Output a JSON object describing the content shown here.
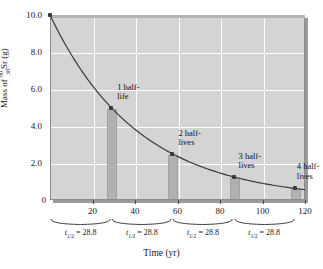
{
  "chart_data": {
    "type": "line",
    "title": "",
    "xlabel": "Time (yr)",
    "ylabel": "Mass of Sr-90 (g)",
    "ylabel_parts": {
      "prefix": "Mass of ",
      "mass_number": "90",
      "atomic_number": "38",
      "element": "Sr",
      "unit": " (g)"
    },
    "xlim": [
      0,
      120
    ],
    "ylim": [
      0,
      10
    ],
    "grid": true,
    "legend": "none",
    "half_life": 28.8,
    "half_life_unit": "yr",
    "initial_mass": 10.0,
    "x_ticks": [
      20,
      40,
      60,
      80,
      100,
      120
    ],
    "y_ticks": [
      "0",
      "2.0",
      "4.0",
      "6.0",
      "8.0",
      "10.0"
    ],
    "y_tick_values": [
      0,
      2.0,
      4.0,
      6.0,
      8.0,
      10.0
    ],
    "x": [
      0,
      28.8,
      57.6,
      86.4,
      115.2
    ],
    "values": [
      10.0,
      5.0,
      2.5,
      1.25,
      0.625
    ],
    "points": [
      {
        "x": 0,
        "y": 10.0,
        "label": "",
        "label2": ""
      },
      {
        "x": 28.8,
        "y": 5.0,
        "label": "1 half-",
        "label2": "life"
      },
      {
        "x": 57.6,
        "y": 2.5,
        "label": "2 half-",
        "label2": "lives"
      },
      {
        "x": 86.4,
        "y": 1.25,
        "label": "3 half-",
        "label2": "lives"
      },
      {
        "x": 115.2,
        "y": 0.625,
        "label": "4 half-",
        "label2": "lives"
      }
    ],
    "braces": [
      {
        "from": 0,
        "to": 28.8,
        "label_prefix": "t",
        "label_sub": "1/2",
        "label_suffix": " = 28.8"
      },
      {
        "from": 28.8,
        "to": 57.6,
        "label_prefix": "t",
        "label_sub": "1/2",
        "label_suffix": " = 28.8"
      },
      {
        "from": 57.6,
        "to": 86.4,
        "label_prefix": "t",
        "label_sub": "1/2",
        "label_suffix": " = 28.8"
      },
      {
        "from": 86.4,
        "to": 115.2,
        "label_prefix": "t",
        "label_sub": "1/2",
        "label_suffix": " = 28.8"
      }
    ],
    "colors": {
      "plot_background": "#d4d4d4",
      "gridline": "#fdfdfd",
      "curve": "#3a3a3a",
      "bar": "#b0b0b0",
      "frame_shadow": "#9a9a9a",
      "text": "#1a1a1a"
    }
  }
}
